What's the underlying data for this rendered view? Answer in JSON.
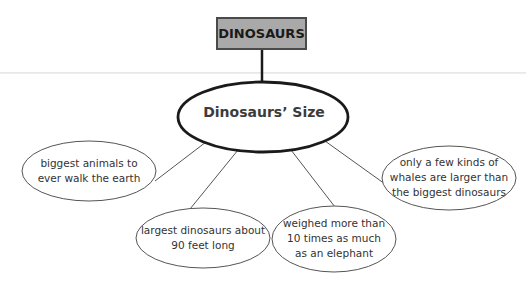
{
  "diagram": {
    "type": "concept-web",
    "title": "DINOSAURS",
    "center": "Dinosaurs’ Size",
    "details": [
      {
        "id": "left",
        "text": "biggest animals to\never walk the earth"
      },
      {
        "id": "bottom-left",
        "text": "largest dinosaurs about\n90 feet long"
      },
      {
        "id": "bottom-right",
        "text": "weighed more than\n10 times as much\nas an elephant"
      },
      {
        "id": "right",
        "text": "only a few kinds of\nwhales are larger than\nthe biggest dinosaurs"
      }
    ]
  },
  "colors": {
    "title_fill": "#a9a9a9",
    "title_border": "#4a4a4a",
    "center_outline": "#1a1a1a",
    "bubble_outline": "#555555",
    "connector": "#555555",
    "text": "#333333"
  }
}
